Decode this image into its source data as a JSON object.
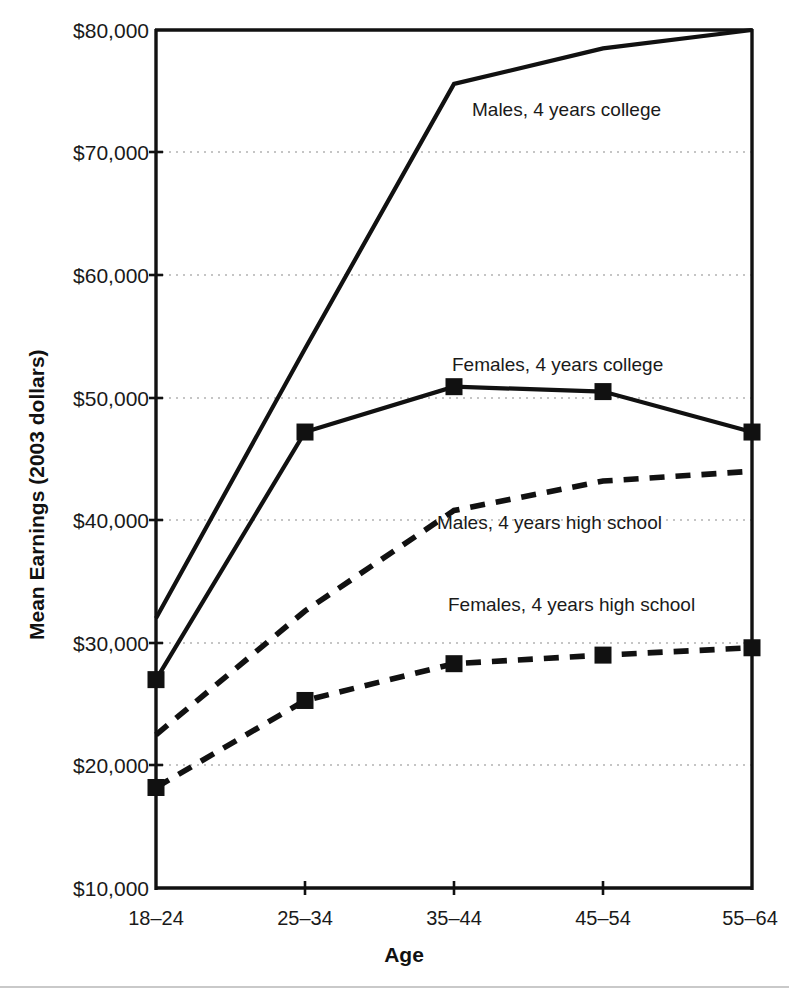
{
  "chart_data": {
    "type": "line",
    "title": "",
    "subtitle": "",
    "xlabel": "Age",
    "ylabel": "Mean Earnings (2003 dollars)",
    "categories": [
      "18–24",
      "25–34",
      "35–44",
      "45–54",
      "55–64"
    ],
    "ylim": [
      10000,
      80000
    ],
    "ytick_values": [
      10000,
      20000,
      30000,
      40000,
      50000,
      60000,
      70000,
      80000
    ],
    "ytick_labels": [
      "$10,000",
      "$20,000",
      "$30,000",
      "$40,000",
      "$50,000",
      "$60,000",
      "$70,000",
      "$80,000"
    ],
    "grid": "horizontal-dotted",
    "legend": "inline-annotations",
    "series": [
      {
        "name": "Males, 4 years college",
        "style": "solid",
        "markers": "none",
        "color": "#111111",
        "values": [
          32000,
          54000,
          75600,
          78500,
          80000
        ],
        "label": "Males, 4 years college"
      },
      {
        "name": "Females, 4 years college",
        "style": "solid",
        "markers": "square",
        "color": "#111111",
        "values": [
          27000,
          47200,
          50900,
          50500,
          47200
        ],
        "label": "Females, 4 years college"
      },
      {
        "name": "Males, 4 years high school",
        "style": "dashed",
        "markers": "none",
        "color": "#111111",
        "values": [
          22500,
          32600,
          40800,
          43200,
          44000
        ],
        "label": "Males, 4 years high school"
      },
      {
        "name": "Females, 4 years high school",
        "style": "dashed",
        "markers": "square",
        "color": "#111111",
        "values": [
          18200,
          25300,
          28300,
          29000,
          29600
        ],
        "label": "Females, 4 years high school"
      }
    ],
    "annotations": [
      {
        "text": "Males, 4 years college",
        "x_px": 472,
        "y_px": 110
      },
      {
        "text": "Females, 4 years college",
        "x_px": 452,
        "y_px": 365
      },
      {
        "text": "Males, 4 years high school",
        "x_px": 437,
        "y_px": 523
      },
      {
        "text": "Females, 4 years high school",
        "x_px": 448,
        "y_px": 605
      }
    ]
  },
  "axis": {
    "y_title": "Mean Earnings (2003 dollars)",
    "x_title": "Age",
    "y_labels": [
      "$80,000",
      "$70,000",
      "$60,000",
      "$50,000",
      "$40,000",
      "$30,000",
      "$20,000",
      "$10,000"
    ],
    "x_labels": [
      "18–24",
      "25–34",
      "35–44",
      "45–54",
      "55–64"
    ]
  },
  "colors": {
    "ink": "#111111",
    "grid": "#999999",
    "background": "#ffffff",
    "rule": "#c9c9c9"
  }
}
